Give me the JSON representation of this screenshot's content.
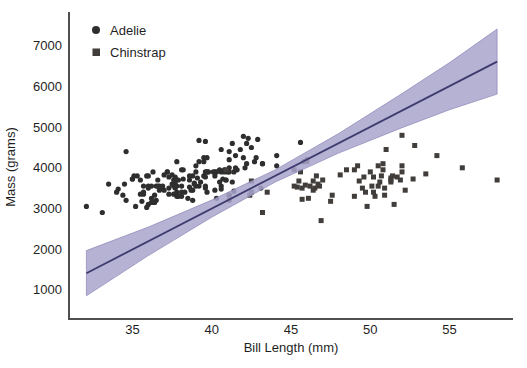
{
  "figure": {
    "xlabel": "Bill Length (mm)",
    "ylabel": "Mass (grams)"
  },
  "chart_data": {
    "type": "scatter",
    "title": "",
    "xlabel": "Bill Length (mm)",
    "ylabel": "Mass (grams)",
    "xlim": [
      31,
      59
    ],
    "ylim": [
      280,
      7760
    ],
    "xticks": [
      35,
      40,
      45,
      50,
      55
    ],
    "yticks": [
      1000,
      2000,
      3000,
      4000,
      5000,
      6000,
      7000
    ],
    "grid": false,
    "legend_position": "upper-left",
    "colors": {
      "adelie": "#2f2e2e",
      "chinstrap": "#403d3b",
      "regression_line": "#3d3a6e",
      "ci_band": "#a9a4cc",
      "axis": "#4f4f51",
      "text": "#1f1f1f",
      "background": "#ffffff"
    },
    "series": [
      {
        "name": "Adelie",
        "marker": "circle",
        "color": "#2f2e2e",
        "marker_size": 5,
        "points": [
          [
            39.1,
            3750
          ],
          [
            39.5,
            3800
          ],
          [
            40.3,
            3250
          ],
          [
            36.7,
            3450
          ],
          [
            39.3,
            3650
          ],
          [
            38.9,
            3625
          ],
          [
            39.2,
            4675
          ],
          [
            34.1,
            3475
          ],
          [
            42.0,
            4250
          ],
          [
            37.8,
            3300
          ],
          [
            37.8,
            3700
          ],
          [
            41.1,
            3200
          ],
          [
            38.6,
            3800
          ],
          [
            34.6,
            4400
          ],
          [
            36.6,
            3700
          ],
          [
            38.7,
            3450
          ],
          [
            42.5,
            4500
          ],
          [
            34.4,
            3325
          ],
          [
            46.0,
            4200
          ],
          [
            37.8,
            3400
          ],
          [
            37.7,
            3600
          ],
          [
            35.9,
            3800
          ],
          [
            38.2,
            3950
          ],
          [
            38.8,
            3800
          ],
          [
            35.3,
            3800
          ],
          [
            40.6,
            3550
          ],
          [
            40.5,
            3950
          ],
          [
            37.9,
            3300
          ],
          [
            40.5,
            3650
          ],
          [
            39.5,
            4150
          ],
          [
            37.2,
            3900
          ],
          [
            39.5,
            4250
          ],
          [
            40.9,
            3700
          ],
          [
            36.4,
            3325
          ],
          [
            39.2,
            3550
          ],
          [
            38.8,
            3200
          ],
          [
            42.2,
            4600
          ],
          [
            37.6,
            3550
          ],
          [
            39.8,
            3900
          ],
          [
            36.5,
            3550
          ],
          [
            40.8,
            3950
          ],
          [
            36.0,
            3500
          ],
          [
            44.1,
            4300
          ],
          [
            37.0,
            3450
          ],
          [
            39.6,
            4650
          ],
          [
            41.1,
            4200
          ],
          [
            37.5,
            3600
          ],
          [
            36.0,
            3100
          ],
          [
            42.3,
            4725
          ],
          [
            39.6,
            3500
          ],
          [
            40.1,
            3900
          ],
          [
            35.0,
            3725
          ],
          [
            42.0,
            4775
          ],
          [
            34.5,
            3600
          ],
          [
            41.4,
            3900
          ],
          [
            39.0,
            3550
          ],
          [
            40.6,
            4450
          ],
          [
            36.5,
            3200
          ],
          [
            37.6,
            3350
          ],
          [
            35.7,
            3550
          ],
          [
            41.3,
            4600
          ],
          [
            37.6,
            3700
          ],
          [
            41.1,
            3325
          ],
          [
            36.4,
            3150
          ],
          [
            41.6,
            3950
          ],
          [
            35.5,
            3350
          ],
          [
            41.1,
            4400
          ],
          [
            35.9,
            3025
          ],
          [
            41.8,
            4450
          ],
          [
            33.5,
            3600
          ],
          [
            39.7,
            3900
          ],
          [
            39.6,
            3550
          ],
          [
            45.8,
            4150
          ],
          [
            35.5,
            3700
          ],
          [
            42.8,
            4250
          ],
          [
            40.9,
            3700
          ],
          [
            37.2,
            3900
          ],
          [
            36.2,
            3550
          ],
          [
            42.1,
            4000
          ],
          [
            34.6,
            3200
          ],
          [
            42.9,
            4700
          ],
          [
            36.7,
            3550
          ],
          [
            35.1,
            3800
          ],
          [
            37.3,
            3500
          ],
          [
            41.3,
            3650
          ],
          [
            36.3,
            3900
          ],
          [
            36.9,
            3550
          ],
          [
            38.3,
            3400
          ],
          [
            38.9,
            3600
          ],
          [
            35.7,
            3400
          ],
          [
            41.1,
            4000
          ],
          [
            34.0,
            3400
          ],
          [
            39.6,
            3900
          ],
          [
            36.2,
            3250
          ],
          [
            40.8,
            3900
          ],
          [
            38.1,
            3300
          ],
          [
            40.3,
            3900
          ],
          [
            33.1,
            2900
          ],
          [
            43.2,
            4100
          ],
          [
            35.0,
            3725
          ],
          [
            41.0,
            3900
          ],
          [
            37.7,
            3775
          ],
          [
            37.8,
            4150
          ],
          [
            37.9,
            3700
          ],
          [
            39.7,
            4250
          ],
          [
            38.6,
            3525
          ],
          [
            38.2,
            3725
          ],
          [
            38.1,
            3950
          ],
          [
            43.2,
            4100
          ],
          [
            38.1,
            3550
          ],
          [
            45.6,
            4625
          ],
          [
            39.7,
            3900
          ],
          [
            42.2,
            4100
          ],
          [
            39.6,
            3775
          ],
          [
            42.7,
            4150
          ],
          [
            38.6,
            3700
          ],
          [
            37.3,
            3775
          ],
          [
            35.7,
            3350
          ],
          [
            41.1,
            3325
          ],
          [
            36.2,
            3150
          ],
          [
            37.7,
            3500
          ],
          [
            40.2,
            3900
          ],
          [
            41.4,
            3425
          ],
          [
            35.2,
            3050
          ],
          [
            40.6,
            3475
          ],
          [
            38.8,
            3450
          ],
          [
            41.5,
            4300
          ],
          [
            39.0,
            4050
          ],
          [
            44.1,
            4050
          ],
          [
            38.5,
            3250
          ],
          [
            43.1,
            3500
          ],
          [
            36.8,
            3500
          ],
          [
            37.5,
            3825
          ],
          [
            38.1,
            3400
          ],
          [
            41.1,
            3900
          ],
          [
            35.6,
            3175
          ],
          [
            40.2,
            3450
          ],
          [
            37.0,
            3825
          ],
          [
            39.7,
            3400
          ],
          [
            40.2,
            3800
          ],
          [
            40.6,
            3900
          ],
          [
            32.1,
            3050
          ],
          [
            40.7,
            3725
          ],
          [
            37.3,
            3350
          ],
          [
            39.0,
            3900
          ],
          [
            39.2,
            4150
          ],
          [
            36.6,
            3550
          ],
          [
            36.0,
            3800
          ],
          [
            37.8,
            3550
          ],
          [
            36.0,
            3550
          ],
          [
            41.5,
            4000
          ]
        ]
      },
      {
        "name": "Chinstrap",
        "marker": "square",
        "color": "#403d3b",
        "marker_size": 5,
        "points": [
          [
            46.5,
            3500
          ],
          [
            50.0,
            3900
          ],
          [
            51.3,
            3650
          ],
          [
            45.4,
            3525
          ],
          [
            52.7,
            3725
          ],
          [
            45.2,
            3950
          ],
          [
            46.1,
            3250
          ],
          [
            51.3,
            3750
          ],
          [
            46.0,
            4150
          ],
          [
            51.3,
            3700
          ],
          [
            46.6,
            3800
          ],
          [
            51.7,
            3775
          ],
          [
            47.0,
            3700
          ],
          [
            52.0,
            4050
          ],
          [
            45.9,
            3575
          ],
          [
            50.5,
            4050
          ],
          [
            50.3,
            3300
          ],
          [
            58.0,
            3700
          ],
          [
            46.4,
            3450
          ],
          [
            49.2,
            4050
          ],
          [
            42.4,
            3325
          ],
          [
            48.5,
            3950
          ],
          [
            43.2,
            2900
          ],
          [
            50.6,
            3650
          ],
          [
            46.7,
            3600
          ],
          [
            52.0,
            3900
          ],
          [
            50.5,
            3550
          ],
          [
            49.5,
            3500
          ],
          [
            46.4,
            3675
          ],
          [
            52.8,
            4550
          ],
          [
            40.9,
            3950
          ],
          [
            54.2,
            4300
          ],
          [
            42.5,
            3400
          ],
          [
            51.0,
            4450
          ],
          [
            49.7,
            3400
          ],
          [
            47.5,
            3175
          ],
          [
            47.6,
            3325
          ],
          [
            52.0,
            4800
          ],
          [
            46.9,
            2700
          ],
          [
            53.5,
            3850
          ],
          [
            49.0,
            3950
          ],
          [
            46.2,
            3550
          ],
          [
            50.9,
            3500
          ],
          [
            45.5,
            3675
          ],
          [
            50.9,
            3325
          ],
          [
            50.8,
            3950
          ],
          [
            50.1,
            3550
          ],
          [
            49.0,
            3300
          ],
          [
            51.5,
            3100
          ],
          [
            49.8,
            3050
          ],
          [
            48.1,
            3825
          ],
          [
            51.4,
            3800
          ],
          [
            45.7,
            3225
          ],
          [
            50.7,
            3800
          ],
          [
            42.5,
            3675
          ],
          [
            52.2,
            3450
          ],
          [
            45.2,
            3550
          ],
          [
            49.3,
            3675
          ],
          [
            50.2,
            3400
          ],
          [
            45.6,
            3900
          ],
          [
            51.9,
            3700
          ],
          [
            46.8,
            3550
          ],
          [
            45.7,
            3500
          ],
          [
            55.8,
            4000
          ],
          [
            43.5,
            3400
          ],
          [
            49.6,
            3775
          ],
          [
            50.8,
            4100
          ],
          [
            50.2,
            3775
          ]
        ]
      }
    ],
    "regression": {
      "line": {
        "x": [
          32.1,
          58.0
        ],
        "y": [
          1407,
          6613
        ],
        "color": "#3d3a6e"
      },
      "ci_band": {
        "color": "#a9a4cc",
        "edge_color": "#8d87b8",
        "opacity": 0.85,
        "points": [
          {
            "x": 32.1,
            "lo": 852,
            "hi": 1962
          },
          {
            "x": 36.0,
            "lo": 1841,
            "hi": 2541
          },
          {
            "x": 40.0,
            "lo": 2785,
            "hi": 3205
          },
          {
            "x": 44.0,
            "lo": 3649,
            "hi": 3949
          },
          {
            "x": 48.0,
            "lo": 4363,
            "hi": 4843
          },
          {
            "x": 52.0,
            "lo": 4987,
            "hi": 5827
          },
          {
            "x": 55.0,
            "lo": 5430,
            "hi": 6590
          },
          {
            "x": 58.0,
            "lo": 5813,
            "hi": 7413
          }
        ]
      }
    },
    "legend": [
      {
        "label": "Adelie",
        "marker": "circle"
      },
      {
        "label": "Chinstrap",
        "marker": "square"
      }
    ]
  }
}
